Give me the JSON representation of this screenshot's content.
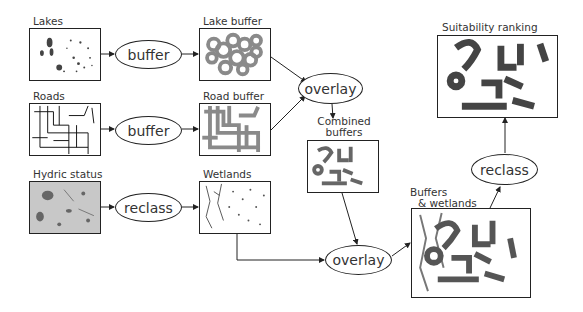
{
  "diagram": {
    "layers": {
      "lakes": {
        "label": "Lakes"
      },
      "lake_buffer": {
        "label": "Lake buffer"
      },
      "roads": {
        "label": "Roads"
      },
      "road_buffer": {
        "label": "Road buffer"
      },
      "hydric": {
        "label": "Hydric status"
      },
      "wetlands": {
        "label": "Wetlands"
      },
      "combined": {
        "label_line1": "Combined",
        "label_line2": "buffers"
      },
      "buffers_wetlands": {
        "label_line1": "Buffers",
        "label_line2": "& wetlands"
      },
      "suitability": {
        "label": "Suitability ranking"
      }
    },
    "operations": {
      "buffer_lakes": "buffer",
      "buffer_roads": "buffer",
      "reclass_hydric": "reclass",
      "overlay_buffers": "overlay",
      "overlay_wetlands": "overlay",
      "reclass_final": "reclass"
    },
    "colors": {
      "stroke": "#222222",
      "buffer_fill": "#8a8a8a",
      "dark_fill": "#555555",
      "hydric_bg": "#c8c8c8"
    }
  }
}
